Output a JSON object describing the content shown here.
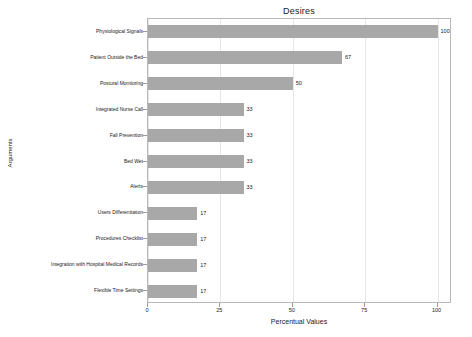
{
  "chart_data": {
    "type": "bar",
    "orientation": "horizontal",
    "title": "Desires",
    "xlabel": "Percentual Values",
    "ylabel": "Arguments",
    "xlim": [
      0,
      105
    ],
    "xticks": [
      0,
      25,
      50,
      75,
      100
    ],
    "xtick_labels": [
      "0",
      "25",
      "50",
      "75",
      "100"
    ],
    "grid": "vertical",
    "legend": "none",
    "bar_color": "#a8a8a8",
    "categories": [
      "Physiological Signals",
      "Patient Outside the Bed",
      "Postural Monitoring",
      "Integrated Nurse Call",
      "Fall Prevention",
      "Bed Wet",
      "Alerts",
      "Users Differentiation",
      "Procedures Checklist",
      "Integration with Hospital Medical Records",
      "Flexible Time Settings"
    ],
    "values": [
      100,
      67,
      50,
      33,
      33,
      33,
      33,
      17,
      17,
      17,
      17
    ],
    "value_labels": [
      "100",
      "67",
      "50",
      "33",
      "33",
      "33",
      "33",
      "17",
      "17",
      "17",
      "17"
    ]
  }
}
